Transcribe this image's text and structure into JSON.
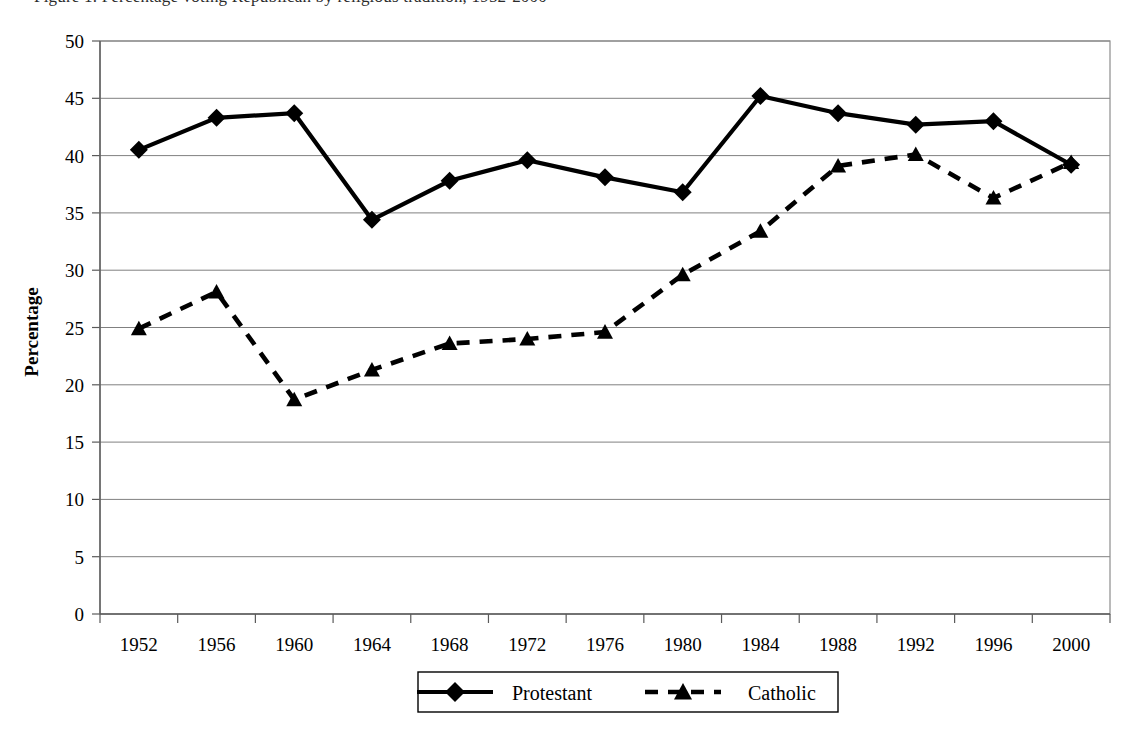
{
  "caption": {
    "text": "Figure 1. Percentage voting Republican by religious tradition, 1952-2000"
  },
  "chart_data": {
    "type": "line",
    "title": "",
    "xlabel": "",
    "ylabel": "Percentage",
    "categories": [
      "1952",
      "1956",
      "1960",
      "1964",
      "1968",
      "1972",
      "1976",
      "1980",
      "1984",
      "1988",
      "1992",
      "1996",
      "2000"
    ],
    "ylim": [
      0,
      50
    ],
    "ytick_step": 5,
    "yticks": [
      "0",
      "5",
      "10",
      "15",
      "20",
      "25",
      "30",
      "35",
      "40",
      "45",
      "50"
    ],
    "grid": "horizontal",
    "legend_position": "bottom",
    "series": [
      {
        "name": "Protestant",
        "marker": "diamond",
        "line_style": "solid",
        "color": "#000000",
        "values": [
          40.5,
          43.3,
          43.7,
          34.4,
          37.8,
          39.6,
          38.1,
          36.8,
          45.2,
          43.7,
          42.7,
          43.0,
          39.2
        ]
      },
      {
        "name": "Catholic",
        "marker": "triangle",
        "line_style": "dashed",
        "color": "#000000",
        "values": [
          24.9,
          28.1,
          18.7,
          21.3,
          23.6,
          24.0,
          24.6,
          29.6,
          33.4,
          39.1,
          40.1,
          36.3,
          39.4
        ]
      }
    ]
  },
  "legend": {
    "items": [
      {
        "label": "Protestant",
        "marker": "diamond",
        "line_style": "solid"
      },
      {
        "label": "Catholic",
        "marker": "triangle",
        "line_style": "dashed"
      }
    ]
  }
}
